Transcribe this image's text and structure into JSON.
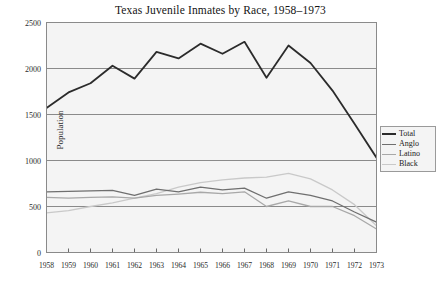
{
  "chart_data": {
    "type": "line",
    "title": "Texas Juvenile Inmates by Race, 1958–1973",
    "xlabel": "",
    "ylabel": "Population",
    "categories": [
      "1958",
      "1959",
      "1960",
      "1961",
      "1962",
      "1963",
      "1964",
      "1965",
      "1966",
      "1967",
      "1968",
      "1969",
      "1970",
      "1971",
      "1972",
      "1973"
    ],
    "x": [
      1958,
      1959,
      1960,
      1961,
      1962,
      1963,
      1964,
      1965,
      1966,
      1967,
      1968,
      1969,
      1970,
      1971,
      1972,
      1973
    ],
    "xlim": [
      1958,
      1973
    ],
    "ylim": [
      0,
      2500
    ],
    "yticks": [
      0,
      500,
      1000,
      1500,
      2000,
      2500
    ],
    "grid": true,
    "legend_position": "right",
    "series": [
      {
        "name": "Total",
        "color": "#2b2b2b",
        "width": 1.8,
        "values": [
          1570,
          1740,
          1840,
          2030,
          1890,
          2180,
          2110,
          2270,
          2160,
          2290,
          1900,
          2250,
          2060,
          1760,
          1400,
          1030
        ]
      },
      {
        "name": "Anglo",
        "color": "#6f6f6f",
        "width": 1.3,
        "values": [
          660,
          665,
          670,
          675,
          620,
          690,
          660,
          710,
          680,
          700,
          590,
          660,
          620,
          560,
          440,
          330
        ]
      },
      {
        "name": "Latino",
        "color": "#a8a8a8",
        "width": 1.3,
        "values": [
          600,
          590,
          600,
          605,
          590,
          620,
          635,
          655,
          640,
          660,
          500,
          560,
          500,
          500,
          400,
          255
        ]
      },
      {
        "name": "Black",
        "color": "#c9c9c9",
        "width": 1.3,
        "values": [
          430,
          455,
          500,
          540,
          590,
          640,
          710,
          760,
          790,
          810,
          820,
          860,
          800,
          680,
          520,
          290
        ]
      }
    ]
  },
  "legend": {
    "entries": [
      {
        "label": "Total"
      },
      {
        "label": "Anglo"
      },
      {
        "label": "Latino"
      },
      {
        "label": "Black"
      }
    ]
  },
  "axes": {
    "y_axis_label": "Population",
    "y_tick_labels": [
      "2500",
      "2000",
      "1500",
      "1000",
      "500",
      "0"
    ],
    "x_tick_labels": [
      "1958",
      "1959",
      "1960",
      "1961",
      "1962",
      "1963",
      "1964",
      "1965",
      "1966",
      "1967",
      "1968",
      "1969",
      "1970",
      "1971",
      "1972",
      "1973"
    ]
  },
  "style": {
    "plot_background": "#f4f4f4",
    "grid_color": "#8a8a8a",
    "axis_color": "#6a6a6a",
    "page_background": "#ffffff"
  }
}
